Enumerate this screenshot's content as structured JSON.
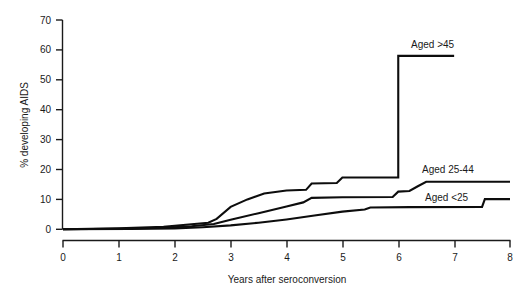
{
  "chart_data": {
    "type": "line",
    "title": "",
    "subtitle": "",
    "xlabel": "Years after seroconversion",
    "ylabel": "% developing AIDS",
    "xlim": [
      0,
      8
    ],
    "ylim": [
      0,
      70
    ],
    "xticks": [
      0,
      1,
      2,
      3,
      4,
      5,
      6,
      7,
      8
    ],
    "xtick_labels": [
      "0",
      "1",
      "2",
      "3",
      "4",
      "5",
      "6",
      "7",
      "8"
    ],
    "yticks": [
      0,
      10,
      20,
      30,
      40,
      50,
      60,
      70
    ],
    "ytick_labels": [
      "0",
      "10",
      "20",
      "30",
      "40",
      "50",
      "60",
      "70"
    ],
    "grid": false,
    "legend_position": "inline-right-of-curve-ends",
    "step_style": "post",
    "series": [
      {
        "name": "Aged >45",
        "label": "Aged >45",
        "color": "#0d0d0d",
        "end_value": 58,
        "x": [
          0,
          1.0,
          1.8,
          2.2,
          2.6,
          2.75,
          3.0,
          3.3,
          3.6,
          4.0,
          4.35,
          4.45,
          4.9,
          5.0,
          5.5,
          6.0,
          6.0,
          7.0
        ],
        "y": [
          0,
          0.3,
          0.8,
          1.5,
          2.2,
          3.5,
          7.5,
          10.0,
          12.0,
          13.0,
          13.2,
          15.3,
          15.5,
          17.3,
          17.3,
          17.3,
          58.0,
          58.0
        ]
      },
      {
        "name": "Aged 25-44",
        "label": "Aged 25-44",
        "color": "#0d0d0d",
        "end_value": 16,
        "x": [
          0,
          1.0,
          1.8,
          2.3,
          2.7,
          3.0,
          3.5,
          4.0,
          4.3,
          4.45,
          5.0,
          5.9,
          6.0,
          6.2,
          6.35,
          6.5,
          8.0
        ],
        "y": [
          0,
          0.2,
          0.5,
          1.0,
          1.8,
          3.2,
          5.4,
          7.6,
          9.0,
          10.5,
          10.7,
          10.8,
          12.6,
          12.8,
          14.4,
          15.9,
          15.9
        ]
      },
      {
        "name": "Aged <25",
        "label": "Aged <25",
        "color": "#0d0d0d",
        "end_value": 10,
        "x": [
          0,
          1.2,
          2.0,
          2.5,
          3.0,
          3.5,
          4.0,
          4.5,
          5.0,
          5.4,
          5.5,
          6.2,
          7.5,
          7.55,
          8.0
        ],
        "y": [
          0,
          0.1,
          0.3,
          0.7,
          1.3,
          2.2,
          3.3,
          4.6,
          5.9,
          6.6,
          7.3,
          7.4,
          7.5,
          10.1,
          10.1
        ]
      }
    ],
    "annotations": [
      {
        "text": "Aged >45",
        "x": 6.25,
        "y": 62
      },
      {
        "text": "Aged 25-44",
        "x": 6.45,
        "y": 20.5
      },
      {
        "text": "Aged <25",
        "x": 6.5,
        "y": 11.5
      }
    ]
  }
}
